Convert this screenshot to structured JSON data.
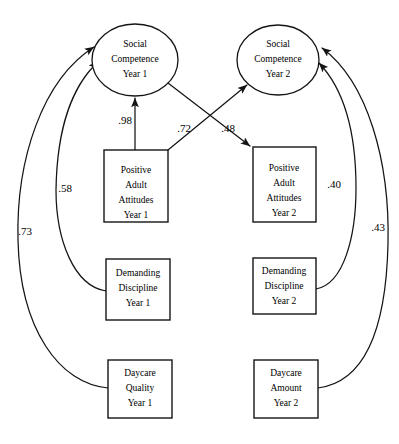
{
  "diagram": {
    "type": "structural-equation-model-path-diagram",
    "width": 399,
    "height": 444,
    "background_color": "#ffffff",
    "line_color": "#141414",
    "latent_variables": [
      {
        "id": "social-competence-year-1",
        "shape": "ellipse",
        "lines": [
          "Social",
          "Competence",
          "Year 1"
        ],
        "line1": "Social",
        "line2": "Competence",
        "line3": "Year 1",
        "cx": 135,
        "cy": 60,
        "rx": 43,
        "ry": 36
      },
      {
        "id": "social-competence-year-2",
        "shape": "ellipse",
        "lines": [
          "Social",
          "Competence",
          "Year 2"
        ],
        "line1": "Social",
        "line2": "Competence",
        "line3": "Year 2",
        "cx": 278,
        "cy": 60,
        "rx": 41,
        "ry": 35
      }
    ],
    "observed_variables": [
      {
        "id": "positive-adult-attitudes-year-1",
        "shape": "rectangle",
        "lines": [
          "Positive",
          "Adult",
          "Attitudes",
          "Year 1"
        ],
        "line1": "Positive",
        "line2": "Adult",
        "line3": "Attitudes",
        "line4": "Year 1",
        "x": 104,
        "y": 150,
        "width": 64,
        "height": 72
      },
      {
        "id": "positive-adult-attitudes-year-2",
        "shape": "rectangle",
        "lines": [
          "Positive",
          "Adult",
          "Attitudes",
          "Year 2"
        ],
        "line1": "Positive",
        "line2": "Adult",
        "line3": "Attitudes",
        "line4": "Year 2",
        "x": 253,
        "y": 147,
        "width": 63,
        "height": 75
      },
      {
        "id": "demanding-discipline-year-1",
        "shape": "rectangle",
        "lines": [
          "Demanding",
          "Discipline",
          "Year 1"
        ],
        "line1": "Demanding",
        "line2": "Discipline",
        "line3": "Year 1",
        "x": 106,
        "y": 259,
        "width": 64,
        "height": 61
      },
      {
        "id": "demanding-discipline-year-2",
        "shape": "rectangle",
        "lines": [
          "Demanding",
          "Discipline",
          "Year 2"
        ],
        "line1": "Demanding",
        "line2": "Discipline",
        "line3": "Year 2",
        "x": 253,
        "y": 258,
        "width": 63,
        "height": 56
      },
      {
        "id": "daycare-quality-year-1",
        "shape": "rectangle",
        "lines": [
          "Daycare",
          "Quality",
          "Year 1"
        ],
        "line1": "Daycare",
        "line2": "Quality",
        "line3": "Year 1",
        "x": 108,
        "y": 360,
        "width": 64,
        "height": 58
      },
      {
        "id": "daycare-amount-year-2",
        "shape": "rectangle",
        "lines": [
          "Daycare",
          "Amount",
          "Year 2"
        ],
        "line1": "Daycare",
        "line2": "Amount",
        "line3": "Year 2",
        "x": 254,
        "y": 360,
        "width": 64,
        "height": 58
      }
    ],
    "paths": [
      {
        "id": "path-paa1-to-sc1",
        "from": "positive-adult-attitudes-year-1",
        "to": "social-competence-year-1",
        "coefficient": ".98",
        "style": "straight",
        "label_x": 125,
        "label_y": 121
      },
      {
        "id": "path-paa1-to-sc2",
        "from": "positive-adult-attitudes-year-1",
        "to": "social-competence-year-2",
        "coefficient": ".72",
        "style": "straight",
        "label_x": 184,
        "label_y": 129
      },
      {
        "id": "path-sc1-to-paa2",
        "from": "social-competence-year-1",
        "to": "positive-adult-attitudes-year-2",
        "coefficient": ".48",
        "style": "straight",
        "label_x": 228,
        "label_y": 129
      },
      {
        "id": "path-dd1-to-sc1",
        "from": "demanding-discipline-year-1",
        "to": "social-competence-year-1",
        "coefficient": ".58",
        "style": "curved",
        "label_x": 65,
        "label_y": 189
      },
      {
        "id": "path-dq1-to-sc1",
        "from": "daycare-quality-year-1",
        "to": "social-competence-year-1",
        "coefficient": ".73",
        "style": "curved",
        "label_x": 25,
        "label_y": 232
      },
      {
        "id": "path-dd2-to-sc2",
        "from": "demanding-discipline-year-2",
        "to": "social-competence-year-2",
        "coefficient": ".40",
        "style": "curved",
        "label_x": 334,
        "label_y": 185
      },
      {
        "id": "path-da2-to-sc2",
        "from": "daycare-amount-year-2",
        "to": "social-competence-year-2",
        "coefficient": ".43",
        "style": "curved",
        "label_x": 378,
        "label_y": 228
      }
    ]
  }
}
